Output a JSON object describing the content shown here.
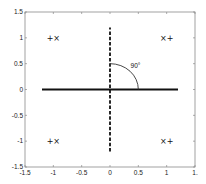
{
  "chart_data": {
    "type": "line",
    "title": "",
    "xlabel": "",
    "ylabel": "",
    "xlim": [
      -1.5,
      1.5
    ],
    "ylim": [
      -1.5,
      1.5
    ],
    "grid": false,
    "legend": null,
    "x_ticks": [
      "-1.5",
      "-1",
      "-0.5",
      "0",
      "0.5",
      "1",
      "1."
    ],
    "x_tick_values": [
      -1.5,
      -1,
      -0.5,
      0,
      0.5,
      1,
      1.5
    ],
    "y_ticks": [
      "1.5",
      "1",
      "0.5",
      "0",
      "-0.5",
      "-1",
      "-1.5"
    ],
    "y_tick_values": [
      1.5,
      1,
      0.5,
      0,
      -0.5,
      -1,
      -1.5
    ],
    "series": [
      {
        "name": "horizontal-solid-line",
        "style": "solid",
        "width": "thick",
        "x": [
          -1.2,
          1.2
        ],
        "y": [
          0,
          0
        ]
      },
      {
        "name": "vertical-dashed-line",
        "style": "dashed",
        "width": "thick",
        "x": [
          0,
          0
        ],
        "y": [
          -1.2,
          1.2
        ]
      },
      {
        "name": "angle-arc",
        "style": "solid",
        "center": [
          0,
          0
        ],
        "radius": 0.5,
        "from_deg": 0,
        "to_deg": 90
      }
    ],
    "markers": [
      {
        "x": -1,
        "y": 1,
        "label": "+×"
      },
      {
        "x": 1,
        "y": 1,
        "label": "×+"
      },
      {
        "x": -1,
        "y": -1,
        "label": "+×"
      },
      {
        "x": 1,
        "y": -1,
        "label": "×+"
      }
    ],
    "annotations": [
      {
        "text": "90°",
        "x": 0.45,
        "y": 0.45
      }
    ]
  }
}
